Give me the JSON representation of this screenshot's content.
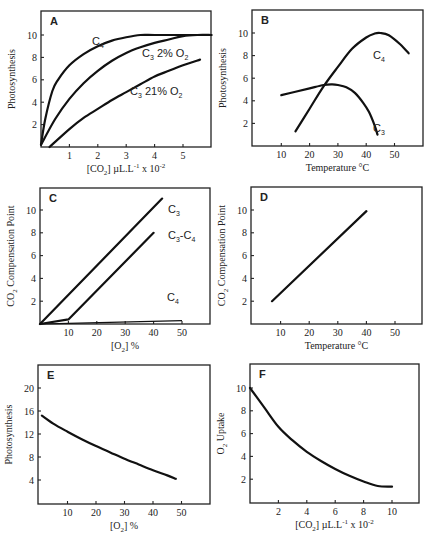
{
  "figure": {
    "panels": [
      "A",
      "B",
      "C",
      "D",
      "E",
      "F"
    ]
  },
  "chart_data": [
    {
      "id": "A",
      "type": "line",
      "title": "A",
      "xlabel": "[CO2] µL.L-1 x 10-2",
      "ylabel": "Photosynthesis",
      "xlim": [
        0,
        6
      ],
      "ylim": [
        0,
        12
      ],
      "xticks": [
        1,
        2,
        3,
        4,
        5
      ],
      "yticks": [
        2,
        4,
        6,
        8,
        10
      ],
      "grid": false,
      "series": [
        {
          "name": "C4",
          "label": "C",
          "sub": "4",
          "x": [
            0,
            0.15,
            0.4,
            0.6,
            1.0,
            1.5,
            2.0,
            2.5,
            3.0,
            3.5,
            4.0,
            5.0,
            6.0
          ],
          "y": [
            0.2,
            2.5,
            5.0,
            6.0,
            7.3,
            8.3,
            9.0,
            9.5,
            9.8,
            10.0,
            10.0,
            10.0,
            10.0
          ]
        },
        {
          "name": "C3 2% O2",
          "label": "C",
          "sub": "3",
          "suffix": " 2% O",
          "suffix_sub": "2",
          "x": [
            0,
            0.5,
            1.0,
            1.5,
            2.0,
            2.5,
            3.0,
            3.5,
            4.0,
            4.5,
            5.0,
            5.5,
            6.0
          ],
          "y": [
            0.2,
            2.5,
            4.3,
            5.7,
            6.8,
            7.7,
            8.4,
            8.9,
            9.3,
            9.6,
            9.9,
            10.0,
            10.0
          ]
        },
        {
          "name": "C3 21% O2",
          "label": "C",
          "sub": "3",
          "suffix": " 21% O",
          "suffix_sub": "2",
          "x": [
            0.3,
            1.0,
            1.5,
            2.0,
            2.5,
            3.0,
            3.5,
            4.0,
            4.5,
            5.0,
            5.6
          ],
          "y": [
            0.0,
            1.6,
            2.6,
            3.4,
            4.2,
            4.9,
            5.6,
            6.3,
            6.8,
            7.3,
            7.8
          ]
        }
      ]
    },
    {
      "id": "B",
      "type": "line",
      "title": "B",
      "xlabel": "Temperature °C",
      "ylabel": "Photosynthesis",
      "xlim": [
        0,
        60
      ],
      "ylim": [
        0,
        12
      ],
      "xticks": [
        10,
        20,
        30,
        40,
        50
      ],
      "yticks": [
        2,
        4,
        6,
        8,
        10
      ],
      "grid": false,
      "series": [
        {
          "name": "C4",
          "label": "C",
          "sub": "4",
          "x": [
            15,
            20,
            25,
            30,
            35,
            40,
            43,
            45,
            48,
            52,
            55
          ],
          "y": [
            1.3,
            3.3,
            5.3,
            7.0,
            8.6,
            9.6,
            9.95,
            10.0,
            9.8,
            9.0,
            8.2
          ]
        },
        {
          "name": "C3",
          "label": "C",
          "sub": "3",
          "x": [
            10,
            15,
            20,
            25,
            28,
            30,
            33,
            36,
            39,
            41,
            43,
            44
          ],
          "y": [
            4.5,
            4.8,
            5.1,
            5.4,
            5.45,
            5.4,
            5.2,
            4.7,
            3.8,
            3.0,
            1.8,
            1.0
          ]
        }
      ]
    },
    {
      "id": "C",
      "type": "line",
      "title": "C",
      "xlabel": "[O2] %",
      "ylabel": "CO2 Compensation Point",
      "xlim": [
        0,
        60
      ],
      "ylim": [
        0,
        12
      ],
      "xticks": [
        10,
        20,
        30,
        40,
        50
      ],
      "yticks": [
        2,
        4,
        6,
        8,
        10
      ],
      "grid": false,
      "series": [
        {
          "name": "C3",
          "label": "C",
          "sub": "3",
          "x": [
            0,
            43
          ],
          "y": [
            0,
            11.0
          ]
        },
        {
          "name": "C3-C4",
          "label": "C",
          "sub": "3",
          "suffix": "-C",
          "suffix_sub": "4",
          "x": [
            0,
            10,
            40
          ],
          "y": [
            0,
            0.4,
            8.0
          ]
        },
        {
          "name": "C4",
          "label": "C",
          "sub": "4",
          "x": [
            0,
            10,
            50
          ],
          "y": [
            0,
            0.05,
            0.3
          ]
        }
      ]
    },
    {
      "id": "D",
      "type": "line",
      "title": "D",
      "xlabel": "Temperature °C",
      "ylabel": "CO2 Compensation Point",
      "xlim": [
        0,
        60
      ],
      "ylim": [
        0,
        12
      ],
      "xticks": [
        10,
        20,
        30,
        40,
        50
      ],
      "yticks": [
        2,
        4,
        6,
        8,
        10
      ],
      "grid": false,
      "series": [
        {
          "name": "line",
          "x": [
            7,
            40
          ],
          "y": [
            2.0,
            9.9
          ]
        }
      ]
    },
    {
      "id": "E",
      "type": "line",
      "title": "E",
      "xlabel": "[O2] %",
      "ylabel": "Photosynthesis",
      "xlim": [
        0,
        60
      ],
      "ylim": [
        0,
        24
      ],
      "xticks": [
        10,
        20,
        30,
        40,
        50
      ],
      "yticks": [
        4,
        8,
        12,
        16,
        20
      ],
      "grid": false,
      "series": [
        {
          "name": "line",
          "x": [
            1,
            5,
            10,
            15,
            20,
            25,
            30,
            35,
            40,
            45,
            48
          ],
          "y": [
            15.2,
            13.8,
            12.4,
            11.1,
            9.9,
            8.8,
            7.7,
            6.7,
            5.7,
            4.8,
            4.2
          ]
        }
      ]
    },
    {
      "id": "F",
      "type": "line",
      "title": "F",
      "xlabel": "[CO2] µL.L-1 x 10-2",
      "ylabel": "O2 Uptake",
      "xlim": [
        0,
        12
      ],
      "ylim": [
        0,
        12
      ],
      "xticks": [
        2,
        4,
        6,
        8,
        10
      ],
      "yticks": [
        2,
        4,
        6,
        8,
        10
      ],
      "grid": false,
      "series": [
        {
          "name": "line",
          "x": [
            0,
            1,
            2,
            3,
            4,
            5,
            6,
            7,
            8,
            9,
            10
          ],
          "y": [
            10.0,
            8.3,
            6.6,
            5.4,
            4.4,
            3.6,
            2.9,
            2.3,
            1.8,
            1.4,
            1.35
          ]
        }
      ]
    }
  ],
  "labels": {
    "A": {
      "letter": "A",
      "ylabel": "Photosynthesis",
      "xlabel_pre": "[CO",
      "xlabel_sub": "2",
      "xlabel_mid": "] µL.L",
      "xlabel_sup1": "-1",
      "xlabel_post": " x 10",
      "xlabel_sup2": "-2"
    },
    "B": {
      "letter": "B",
      "ylabel": "Photosynthesis",
      "xlabel": "Temperature °C"
    },
    "C": {
      "letter": "C",
      "ylabel_pre": "CO",
      "ylabel_sub": "2",
      "ylabel_post": " Compensation Point",
      "xlabel_pre": "[O",
      "xlabel_sub": "2",
      "xlabel_post": "] %"
    },
    "D": {
      "letter": "D",
      "ylabel_pre": "CO",
      "ylabel_sub": "2",
      "ylabel_post": " Compensation Point",
      "xlabel": "Temperature °C"
    },
    "E": {
      "letter": "E",
      "ylabel": "Photosynthesis",
      "xlabel_pre": "[O",
      "xlabel_sub": "2",
      "xlabel_post": "] %"
    },
    "F": {
      "letter": "F",
      "ylabel_pre": "O",
      "ylabel_sub": "2",
      "ylabel_post": " Uptake",
      "xlabel_pre": "[CO",
      "xlabel_sub": "2",
      "xlabel_mid": "] µL.L",
      "xlabel_sup1": "-1",
      "xlabel_post": " x 10",
      "xlabel_sup2": "-2"
    }
  }
}
